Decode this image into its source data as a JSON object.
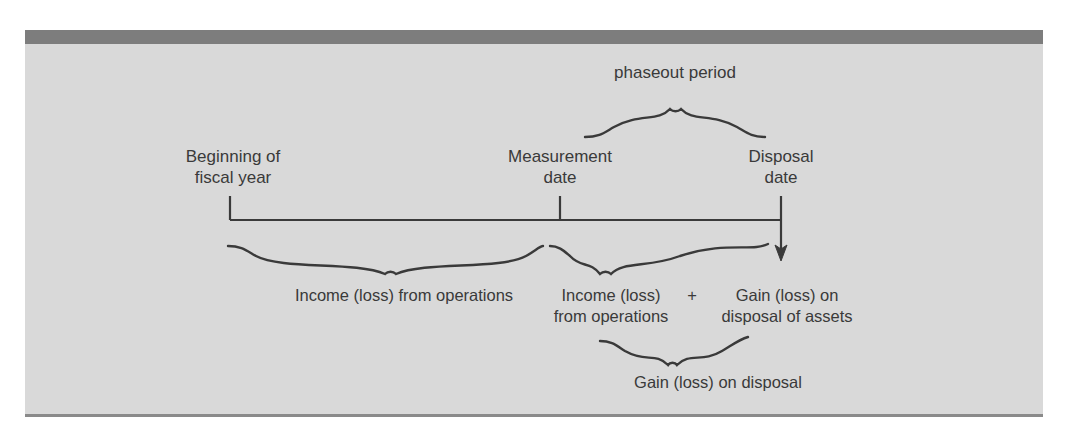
{
  "figure": {
    "background_color": "#d9d9d9",
    "top_bar_color": "#7d7d7d",
    "line_color": "#3a3a3a",
    "text_color": "#3a3a3a"
  },
  "labels": {
    "phaseout_period": "phaseout period",
    "beginning_of_fiscal_year": "Beginning of\nfiscal year",
    "measurement_date": "Measurement\ndate",
    "disposal_date": "Disposal\ndate",
    "income_loss_from_operations_1": "Income (loss) from operations",
    "income_loss_from_operations_2": "Income (loss)\nfrom operations",
    "plus_sign": "+",
    "gain_loss_on_disposal_of_assets": "Gain (loss) on\ndisposal of assets",
    "gain_loss_on_disposal": "Gain (loss) on disposal"
  },
  "timeline": {
    "axis_y": 220,
    "marks": [
      {
        "name": "beginning-of-fiscal-year",
        "x": 230
      },
      {
        "name": "measurement-date",
        "x": 560
      },
      {
        "name": "disposal-date",
        "x": 781
      }
    ],
    "arrow": {
      "name": "disposal-arrow",
      "x": 781,
      "y_end": 259,
      "direction": "down"
    }
  },
  "braces": [
    {
      "name": "phaseout-period-brace",
      "x_start": 585,
      "x_end": 765,
      "apex_x": 675,
      "orientation": "up"
    },
    {
      "name": "income-loss-operations-brace-1",
      "x_start": 228,
      "x_end": 543,
      "apex_x": 390,
      "orientation": "down"
    },
    {
      "name": "income-loss-operations-brace-2",
      "x_start": 550,
      "x_end": 768,
      "apex_x": 605,
      "orientation": "down"
    },
    {
      "name": "gain-loss-disposal-brace",
      "x_start": 600,
      "x_end": 748,
      "apex_x": 673,
      "orientation": "down"
    }
  ]
}
